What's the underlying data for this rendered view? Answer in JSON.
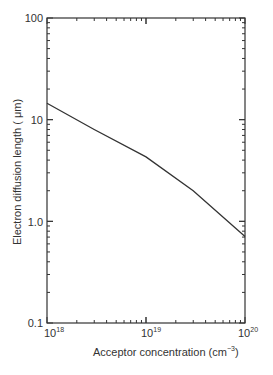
{
  "chart_data": {
    "type": "line",
    "title": "",
    "xlabel": "Acceptor concentration (cm⁻³)",
    "ylabel": "Electron diffusion length (μm)",
    "xscale": "log",
    "yscale": "log",
    "xlim": [
      1e+18,
      1e+20
    ],
    "ylim": [
      0.1,
      100
    ],
    "x_tick_labels": [
      "10¹⁸",
      "10¹⁹",
      "10²⁰"
    ],
    "y_tick_labels": [
      "100",
      "10",
      "1.0",
      "0.1"
    ],
    "grid": false,
    "legend": null,
    "series": [
      {
        "name": "Electron diffusion length",
        "x": [
          1e+18,
          3e+18,
          1e+19,
          3e+19,
          1e+20
        ],
        "y": [
          14.5,
          8.0,
          4.3,
          2.0,
          0.71
        ]
      }
    ]
  },
  "axes": {
    "xlabel_main": "Acceptor concentration (cm",
    "xlabel_exp": "−3",
    "xlabel_close": ")",
    "ylabel": "Electron diffusion length ( μm)",
    "yticks": [
      "100",
      "10",
      "1.0",
      "0.1"
    ],
    "xticks_base": [
      "10",
      "10",
      "10"
    ],
    "xticks_exp": [
      "18",
      "19",
      "20"
    ]
  }
}
